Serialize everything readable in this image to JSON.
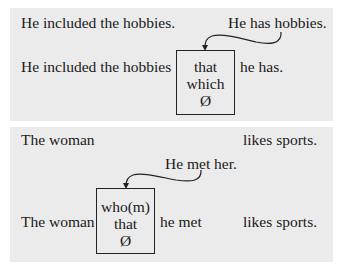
{
  "panels": [
    {
      "main_sentence": "He included the hobbies.",
      "embedded_sentence": "He has hobbies.",
      "combined": {
        "head": "He included the hobbies",
        "relativizers": [
          "that",
          "which",
          "Ø"
        ],
        "rest": "he has."
      }
    },
    {
      "main_sentence": {
        "subject": "The woman",
        "predicate": "likes sports."
      },
      "embedded_sentence": "He met her.",
      "combined": {
        "head": "The woman",
        "relativizers": [
          "who(m)",
          "that",
          "Ø"
        ],
        "rest": "he met",
        "predicate": "likes sports."
      }
    }
  ],
  "colors": {
    "panel_bg": "#ebebeb",
    "text": "#1a1a1a",
    "box_border": "#222222"
  }
}
